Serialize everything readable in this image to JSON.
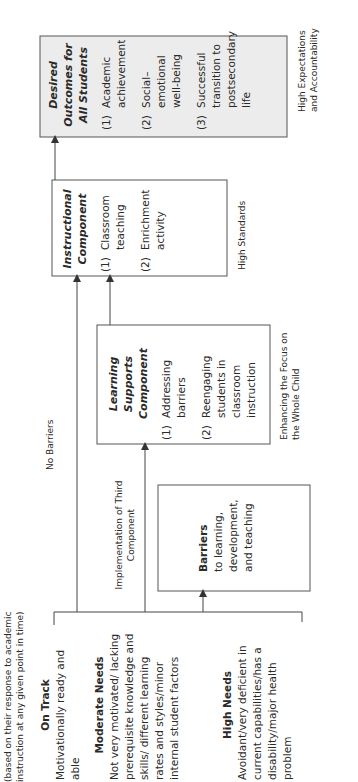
{
  "diagram": {
    "header_note": "(based on their response to academic instruction at any given point in time)",
    "student_groups": [
      {
        "title": "On Track",
        "description": "Motivationally ready and able"
      },
      {
        "title": "Moderate Needs",
        "description": "Not very motivated/ lacking prerequisite knowledge and skills/ different learning rates and styles/minor internal student factors"
      },
      {
        "title": "High Needs",
        "description": "Avoidant/very deficient in current capabilities/has a disability/major health problem"
      }
    ],
    "barriers": {
      "title": "Barriers",
      "description": "to learning, development, and teaching"
    },
    "edge_labels": {
      "no_barriers": "No Barriers",
      "implementation": "Implementation of Third Component"
    },
    "learning_supports": {
      "title": "Learning Supports Component",
      "items": [
        {
          "num": "(1)",
          "text": "Addressing barriers"
        },
        {
          "num": "(2)",
          "text": "Reengaging students in classroom instruction"
        }
      ],
      "caption": "Enhancing the Focus on the Whole Child"
    },
    "instructional": {
      "title": "Instructional Component",
      "items": [
        {
          "num": "(1)",
          "text": "Classroom teaching"
        },
        {
          "num": "(2)",
          "text": "Enrichment activity"
        }
      ],
      "caption": "High Standards"
    },
    "outcomes": {
      "title": "Desired Outcomes for All Students",
      "items": [
        {
          "num": "(1)",
          "text": "Academic achievement"
        },
        {
          "num": "(2)",
          "text": "Social–emotional well-being"
        },
        {
          "num": "(3)",
          "text": "Successful transition to postsecondary life"
        }
      ],
      "caption": "High Expectations and Accountability",
      "fill": "#ececec"
    },
    "colors": {
      "line": "#444444",
      "text": "#2a2a2a",
      "outcome_fill": "#ececec"
    }
  }
}
